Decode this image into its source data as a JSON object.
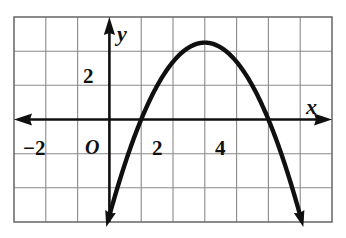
{
  "figure": {
    "kind": "coordinate-grid-parabola",
    "background_color": "#ffffff",
    "grid_color": "#8a8a8a",
    "grid_border_color": "#6e6e6e",
    "axis_color": "#101010",
    "curve_color": "#101010"
  },
  "labels": {
    "y_axis_label": "y",
    "x_axis_label": "x",
    "origin_label": "O",
    "y_tick_2": "2",
    "x_tick_neg2": "−2",
    "x_tick_2": "2",
    "x_tick_4": "4"
  },
  "chart_data": {
    "type": "line",
    "title": "",
    "xlabel": "x",
    "ylabel": "y",
    "xlim": [
      -3,
      7
    ],
    "ylim": [
      -3,
      3
    ],
    "grid": true,
    "legend": false,
    "x_ticks": [
      -2,
      2,
      4
    ],
    "y_ticks": [
      2
    ],
    "x_tick_labels": [
      "−2",
      "2",
      "4"
    ],
    "y_tick_labels": [
      "2"
    ],
    "x_major_step": 1,
    "y_major_step": 1,
    "origin_label": "O",
    "axis_arrows": [
      "left",
      "right",
      "up"
    ],
    "series": [
      {
        "name": "parabola",
        "shape": "downward parabola",
        "equation": "y = -0.5625(x - 1)(x - 5)",
        "vertex": [
          3,
          2.25
        ],
        "x_intercepts": [
          1,
          5
        ],
        "opens": "down",
        "endpoints_arrows": [
          "down-left",
          "down-right"
        ],
        "x": [
          0.2,
          0.6,
          1.0,
          1.5,
          2.0,
          2.5,
          3.0,
          3.5,
          4.0,
          4.5,
          5.0,
          5.4,
          5.8
        ],
        "y": [
          -0.69,
          -0.21,
          0.0,
          0.98,
          1.69,
          2.11,
          2.25,
          2.11,
          1.69,
          0.98,
          0.0,
          -0.67,
          -1.46
        ]
      }
    ]
  }
}
